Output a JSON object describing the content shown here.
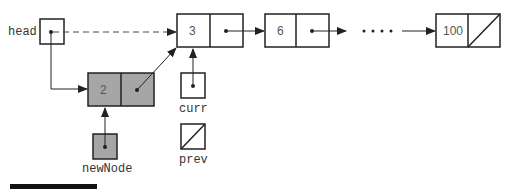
{
  "diagram": {
    "type": "linked-list-insertion",
    "pointers": {
      "head": {
        "label": "head",
        "state": "points-to-node-3 (dashed: old link)"
      },
      "newNode": {
        "label": "newNode",
        "state": "points-to-node-2"
      },
      "curr": {
        "label": "curr",
        "state": "points-to-node-3"
      },
      "prev": {
        "label": "prev",
        "state": "null"
      }
    },
    "nodes": [
      {
        "id": "n2",
        "value": "2",
        "shaded": true,
        "next": "n3"
      },
      {
        "id": "n3",
        "value": "3",
        "shaded": false,
        "next": "n6"
      },
      {
        "id": "n6",
        "value": "6",
        "shaded": false,
        "next": "ellipsis"
      },
      {
        "id": "n100",
        "value": "100",
        "shaded": false,
        "next": "null"
      }
    ],
    "ellipsis": "• • • •",
    "colors": {
      "stroke": "#222222",
      "shaded_fill": "#a6a6a6",
      "background": "#ffffff"
    }
  }
}
